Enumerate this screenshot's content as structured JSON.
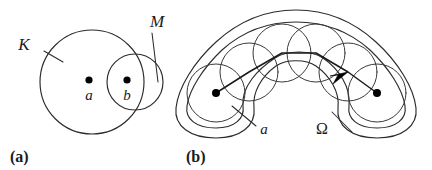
{
  "figure": {
    "background_color": "#ffffff",
    "stroke_color": "#2b2b2b",
    "width": 432,
    "height": 170
  },
  "panel_a": {
    "caption": "(a)",
    "labels": {
      "big_set": "K",
      "small_set": "M",
      "point_a": "a",
      "point_b": "b"
    },
    "shapes": {
      "circle_K": {
        "cx": 92,
        "cy": 82,
        "r": 52
      },
      "circle_M": {
        "cx": 135,
        "cy": 82,
        "r": 28
      },
      "dot_a": {
        "cx": 89,
        "cy": 80,
        "r": 3.6
      },
      "dot_b": {
        "cx": 127,
        "cy": 80,
        "r": 3.6
      }
    }
  },
  "panel_b": {
    "caption": "(b)",
    "labels": {
      "start_point": "a",
      "domain": "Ω"
    },
    "shapes": {
      "dot_a": {
        "cx": 216,
        "cy": 93,
        "r": 4.0
      },
      "dot_end": {
        "cx": 377,
        "cy": 93,
        "r": 4.0
      },
      "chain_circles": [
        {
          "cx": 216,
          "cy": 93,
          "r": 29
        },
        {
          "cx": 249,
          "cy": 72,
          "r": 29
        },
        {
          "cx": 282,
          "cy": 53,
          "r": 29
        },
        {
          "cx": 316,
          "cy": 53,
          "r": 29
        },
        {
          "cx": 348,
          "cy": 72,
          "r": 29
        },
        {
          "cx": 377,
          "cy": 93,
          "r": 29
        }
      ]
    }
  },
  "meta": {
    "icons": {
      "arrow": "arrow-head-icon",
      "dot": "filled-point-icon"
    }
  }
}
